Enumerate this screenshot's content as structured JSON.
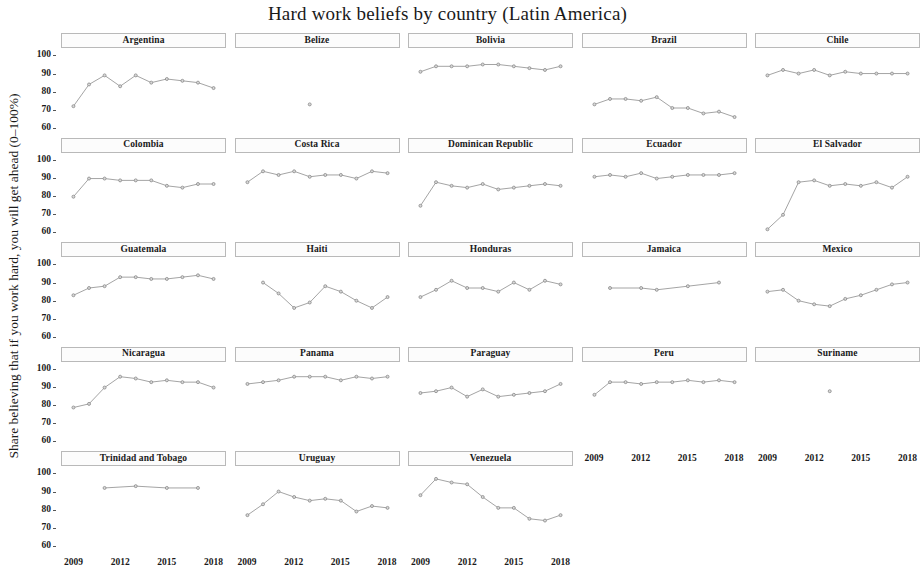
{
  "chart_data": {
    "type": "line",
    "title": "Hard work beliefs by country (Latin America)",
    "xlabel": "",
    "ylabel": "Share believing that if you work hard, you will get ahead (0–100%)",
    "xlim": [
      2008.2,
      2018.8
    ],
    "ylim": [
      55,
      103
    ],
    "yticks": [
      60,
      70,
      80,
      90,
      100
    ],
    "xticks": [
      2009,
      2012,
      2015,
      2018
    ],
    "grid": false,
    "legend": "none",
    "facet_layout": {
      "rows": 5,
      "cols": 5
    },
    "marker": "circle",
    "line_color": "#9a9a9a",
    "marker_color": "#8a8a8a",
    "strip_background": "#fcfcfc",
    "strip_border": "#b9b9b9",
    "panels": [
      {
        "name": "Argentina",
        "row": 0,
        "col": 0,
        "x": [
          2009,
          2010,
          2011,
          2012,
          2013,
          2014,
          2015,
          2016,
          2017,
          2018
        ],
        "y": [
          72,
          84,
          89,
          83,
          89,
          85,
          87,
          86,
          85,
          82
        ]
      },
      {
        "name": "Belize",
        "row": 0,
        "col": 1,
        "x": [
          2013
        ],
        "y": [
          73
        ]
      },
      {
        "name": "Bolivia",
        "row": 0,
        "col": 2,
        "x": [
          2009,
          2010,
          2011,
          2012,
          2013,
          2014,
          2015,
          2016,
          2017,
          2018
        ],
        "y": [
          91,
          94,
          94,
          94,
          95,
          95,
          94,
          93,
          92,
          94
        ]
      },
      {
        "name": "Brazil",
        "row": 0,
        "col": 3,
        "x": [
          2009,
          2010,
          2011,
          2012,
          2013,
          2014,
          2015,
          2016,
          2017,
          2018
        ],
        "y": [
          73,
          76,
          76,
          75,
          77,
          71,
          71,
          68,
          69,
          66
        ]
      },
      {
        "name": "Chile",
        "row": 0,
        "col": 4,
        "x": [
          2009,
          2010,
          2011,
          2012,
          2013,
          2014,
          2015,
          2016,
          2017,
          2018
        ],
        "y": [
          89,
          92,
          90,
          92,
          89,
          91,
          90,
          90,
          90,
          90
        ]
      },
      {
        "name": "Colombia",
        "row": 1,
        "col": 0,
        "x": [
          2009,
          2010,
          2011,
          2012,
          2013,
          2014,
          2015,
          2016,
          2017,
          2018
        ],
        "y": [
          80,
          90,
          90,
          89,
          89,
          89,
          86,
          85,
          87,
          87
        ]
      },
      {
        "name": "Costa Rica",
        "row": 1,
        "col": 1,
        "x": [
          2009,
          2010,
          2011,
          2012,
          2013,
          2014,
          2015,
          2016,
          2017,
          2018
        ],
        "y": [
          88,
          94,
          92,
          94,
          91,
          92,
          92,
          90,
          94,
          93
        ]
      },
      {
        "name": "Dominican Republic",
        "row": 1,
        "col": 2,
        "x": [
          2009,
          2010,
          2011,
          2012,
          2013,
          2014,
          2015,
          2016,
          2017,
          2018
        ],
        "y": [
          75,
          88,
          86,
          85,
          87,
          84,
          85,
          86,
          87,
          86
        ]
      },
      {
        "name": "Ecuador",
        "row": 1,
        "col": 3,
        "x": [
          2009,
          2010,
          2011,
          2012,
          2013,
          2014,
          2015,
          2016,
          2017,
          2018
        ],
        "y": [
          91,
          92,
          91,
          93,
          90,
          91,
          92,
          92,
          92,
          93
        ]
      },
      {
        "name": "El Salvador",
        "row": 1,
        "col": 4,
        "x": [
          2009,
          2010,
          2011,
          2012,
          2013,
          2014,
          2015,
          2016,
          2017,
          2018
        ],
        "y": [
          62,
          70,
          88,
          89,
          86,
          87,
          86,
          88,
          85,
          91
        ]
      },
      {
        "name": "Guatemala",
        "row": 2,
        "col": 0,
        "x": [
          2009,
          2010,
          2011,
          2012,
          2013,
          2014,
          2015,
          2016,
          2017,
          2018
        ],
        "y": [
          83,
          87,
          88,
          93,
          93,
          92,
          92,
          93,
          94,
          92
        ]
      },
      {
        "name": "Haiti",
        "row": 2,
        "col": 1,
        "x": [
          2010,
          2011,
          2012,
          2013,
          2014,
          2015,
          2016,
          2017,
          2018
        ],
        "y": [
          90,
          84,
          76,
          79,
          88,
          85,
          80,
          76,
          82
        ]
      },
      {
        "name": "Honduras",
        "row": 2,
        "col": 2,
        "x": [
          2009,
          2010,
          2011,
          2012,
          2013,
          2014,
          2015,
          2016,
          2017,
          2018
        ],
        "y": [
          82,
          86,
          91,
          87,
          87,
          85,
          90,
          86,
          91,
          89
        ]
      },
      {
        "name": "Jamaica",
        "row": 2,
        "col": 3,
        "x": [
          2010,
          2012,
          2013,
          2015,
          2017
        ],
        "y": [
          87,
          87,
          86,
          88,
          90
        ]
      },
      {
        "name": "Mexico",
        "row": 2,
        "col": 4,
        "x": [
          2009,
          2010,
          2011,
          2012,
          2013,
          2014,
          2015,
          2016,
          2017,
          2018
        ],
        "y": [
          85,
          86,
          80,
          78,
          77,
          81,
          83,
          86,
          89,
          90
        ]
      },
      {
        "name": "Nicaragua",
        "row": 3,
        "col": 0,
        "x": [
          2009,
          2010,
          2011,
          2012,
          2013,
          2014,
          2015,
          2016,
          2017,
          2018
        ],
        "y": [
          79,
          81,
          90,
          96,
          95,
          93,
          94,
          93,
          93,
          90
        ]
      },
      {
        "name": "Panama",
        "row": 3,
        "col": 1,
        "x": [
          2009,
          2010,
          2011,
          2012,
          2013,
          2014,
          2015,
          2016,
          2017,
          2018
        ],
        "y": [
          92,
          93,
          94,
          96,
          96,
          96,
          94,
          96,
          95,
          96
        ]
      },
      {
        "name": "Paraguay",
        "row": 3,
        "col": 2,
        "x": [
          2009,
          2010,
          2011,
          2012,
          2013,
          2014,
          2015,
          2016,
          2017,
          2018
        ],
        "y": [
          87,
          88,
          90,
          85,
          89,
          85,
          86,
          87,
          88,
          92
        ]
      },
      {
        "name": "Peru",
        "row": 3,
        "col": 3,
        "x": [
          2009,
          2010,
          2011,
          2012,
          2013,
          2014,
          2015,
          2016,
          2017,
          2018
        ],
        "y": [
          86,
          93,
          93,
          92,
          93,
          93,
          94,
          93,
          94,
          93
        ]
      },
      {
        "name": "Suriname",
        "row": 3,
        "col": 4,
        "x": [
          2013
        ],
        "y": [
          88
        ]
      },
      {
        "name": "Trinidad and Tobago",
        "row": 4,
        "col": 0,
        "x": [
          2011,
          2013,
          2015,
          2017
        ],
        "y": [
          92,
          93,
          92,
          92
        ]
      },
      {
        "name": "Uruguay",
        "row": 4,
        "col": 1,
        "x": [
          2009,
          2010,
          2011,
          2012,
          2013,
          2014,
          2015,
          2016,
          2017,
          2018
        ],
        "y": [
          77,
          83,
          90,
          87,
          85,
          86,
          85,
          79,
          82,
          81
        ]
      },
      {
        "name": "Venezuela",
        "row": 4,
        "col": 2,
        "x": [
          2009,
          2010,
          2011,
          2012,
          2013,
          2014,
          2015,
          2016,
          2017,
          2018
        ],
        "y": [
          88,
          97,
          95,
          94,
          87,
          81,
          81,
          75,
          74,
          77
        ]
      }
    ],
    "xaxis_rows": [
      {
        "row": 3,
        "cols": [
          3,
          4
        ]
      },
      {
        "row": 4,
        "cols": [
          0,
          1,
          2
        ]
      }
    ]
  }
}
